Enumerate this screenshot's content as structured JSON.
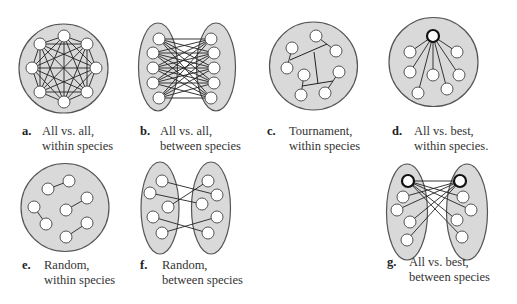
{
  "colors": {
    "region_fill": "#d9d9d9",
    "region_stroke": "#555555",
    "node_fill": "#ffffff",
    "node_stroke": "#444444",
    "best_node_stroke": "#111111",
    "edge": "#222222",
    "background": "#ffffff"
  },
  "panels": [
    {
      "id": "a",
      "letter": "a.",
      "line1": "All vs. all,",
      "line2": "within species",
      "caption_pos": [
        22,
        124
      ],
      "regions": [
        {
          "type": "circle",
          "cx": 63.5,
          "cy": 68.5,
          "r": 44.5
        }
      ],
      "nodes": [
        [
          64,
          36
        ],
        [
          87,
          44
        ],
        [
          96,
          68
        ],
        [
          87,
          92
        ],
        [
          64,
          102
        ],
        [
          40,
          92
        ],
        [
          32,
          68
        ],
        [
          40,
          44
        ]
      ],
      "best": [],
      "edges": "complete"
    },
    {
      "id": "b",
      "letter": "b.",
      "line1": "All vs. all,",
      "line2": "between species",
      "caption_pos": [
        140,
        124
      ],
      "regions": [
        {
          "type": "ellipse",
          "cx": 158,
          "cy": 67,
          "rx": 19.5,
          "ry": 44
        },
        {
          "type": "ellipse",
          "cx": 216,
          "cy": 67,
          "rx": 19.5,
          "ry": 44
        }
      ],
      "nodes": [
        [
          159,
          39
        ],
        [
          153,
          53
        ],
        [
          153,
          68
        ],
        [
          153,
          83
        ],
        [
          159,
          98
        ],
        [
          211,
          39
        ],
        [
          214,
          53
        ],
        [
          214,
          68
        ],
        [
          214,
          83
        ],
        [
          211,
          98
        ]
      ],
      "best": [],
      "edges": "bipartite"
    },
    {
      "id": "c",
      "letter": "c.",
      "line1": "Tournament,",
      "line2": "within species",
      "caption_pos": [
        267,
        124
      ],
      "regions": [
        {
          "type": "circle",
          "cx": 313.5,
          "cy": 66,
          "r": 44
        }
      ],
      "nodes": [
        [
          316,
          36
        ],
        [
          336,
          51
        ],
        [
          292,
          48
        ],
        [
          287,
          68
        ],
        [
          304,
          75
        ],
        [
          301,
          95
        ],
        [
          339,
          72
        ],
        [
          325,
          93
        ]
      ],
      "best": [],
      "edges": [
        [
          0,
          1
        ],
        [
          2,
          3
        ],
        [
          4,
          5
        ],
        [
          6,
          7
        ]
      ],
      "extra_lines": [
        [
          290,
          60,
          327,
          44
        ],
        [
          314,
          52,
          318,
          84
        ],
        [
          302,
          86,
          333,
          81
        ]
      ]
    },
    {
      "id": "d",
      "letter": "d.",
      "line1": "All vs. best,",
      "line2": "within species.",
      "caption_pos": [
        392,
        124
      ],
      "regions": [
        {
          "type": "circle",
          "cx": 433.5,
          "cy": 62,
          "r": 44.5
        }
      ],
      "nodes": [
        [
          433,
          36
        ],
        [
          410,
          52
        ],
        [
          457,
          52
        ],
        [
          410,
          72
        ],
        [
          433,
          75
        ],
        [
          459,
          75
        ],
        [
          418,
          93
        ],
        [
          447,
          89
        ]
      ],
      "best": [
        0
      ],
      "edges": [
        [
          0,
          1
        ],
        [
          0,
          2
        ],
        [
          0,
          3
        ],
        [
          0,
          4
        ],
        [
          0,
          5
        ],
        [
          0,
          6
        ],
        [
          0,
          7
        ]
      ]
    },
    {
      "id": "e",
      "letter": "e.",
      "line1": "Random,",
      "line2": "within species",
      "caption_pos": [
        22,
        258
      ],
      "regions": [
        {
          "type": "circle",
          "cx": 65,
          "cy": 207.5,
          "r": 44
        }
      ],
      "nodes": [
        [
          48,
          189
        ],
        [
          69,
          181
        ],
        [
          34,
          207
        ],
        [
          46,
          224
        ],
        [
          66,
          210
        ],
        [
          87,
          198
        ],
        [
          66,
          237
        ],
        [
          87,
          223
        ]
      ],
      "best": [],
      "edges": [
        [
          0,
          1
        ],
        [
          2,
          3
        ],
        [
          4,
          5
        ],
        [
          6,
          7
        ]
      ]
    },
    {
      "id": "f",
      "letter": "f.",
      "line1": "Random,",
      "line2": "between species",
      "caption_pos": [
        140,
        258
      ],
      "regions": [
        {
          "type": "ellipse",
          "cx": 160,
          "cy": 208,
          "rx": 19,
          "ry": 46
        },
        {
          "type": "ellipse",
          "cx": 211,
          "cy": 208,
          "rx": 19.5,
          "ry": 46
        }
      ],
      "nodes": [
        [
          162,
          181
        ],
        [
          150,
          193
        ],
        [
          168,
          207
        ],
        [
          153,
          217
        ],
        [
          162,
          233
        ],
        [
          208,
          181
        ],
        [
          217,
          195
        ],
        [
          202,
          204
        ],
        [
          217,
          217
        ],
        [
          208,
          233
        ]
      ],
      "best": [],
      "edges": [
        [
          0,
          6
        ],
        [
          1,
          7
        ],
        [
          2,
          5
        ],
        [
          3,
          9
        ],
        [
          4,
          8
        ]
      ]
    },
    {
      "id": "g",
      "letter": "g.",
      "line1": "All vs. best,",
      "line2": "between species",
      "caption_pos": [
        387,
        255
      ],
      "regions": [
        {
          "type": "ellipse",
          "cx": 407,
          "cy": 212,
          "rx": 20.5,
          "ry": 48
        },
        {
          "type": "ellipse",
          "cx": 467,
          "cy": 212,
          "rx": 20.5,
          "ry": 48
        }
      ],
      "nodes": [
        [
          408,
          181
        ],
        [
          403,
          197
        ],
        [
          397,
          210
        ],
        [
          410,
          222
        ],
        [
          407,
          240
        ],
        [
          460,
          181
        ],
        [
          463,
          197
        ],
        [
          471,
          210
        ],
        [
          457,
          220
        ],
        [
          462,
          237
        ]
      ],
      "best": [
        0,
        5
      ],
      "edges": [
        [
          0,
          5
        ],
        [
          0,
          6
        ],
        [
          0,
          7
        ],
        [
          0,
          8
        ],
        [
          0,
          9
        ],
        [
          5,
          1
        ],
        [
          5,
          2
        ],
        [
          5,
          3
        ],
        [
          5,
          4
        ]
      ]
    }
  ],
  "node_radius": 6
}
